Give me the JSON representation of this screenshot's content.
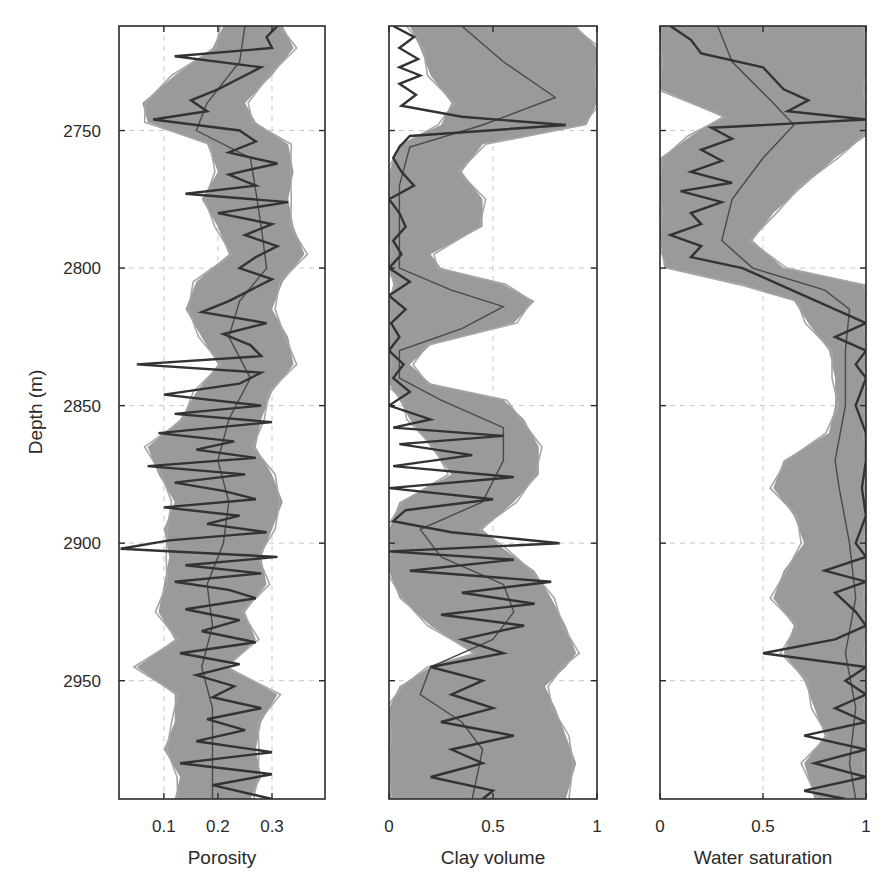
{
  "chart_data": {
    "type": "line",
    "layout": "three vertical well-log tracks sharing a depth axis (depth increasing downward)",
    "ylabel": "Depth (m)",
    "ylim": [
      2712,
      2993
    ],
    "yticks": [
      2750,
      2800,
      2850,
      2900,
      2950
    ],
    "grid": true,
    "legend": null,
    "colors": {
      "ensemble": "#9a9a9a",
      "ensemble_outline": "#a6a6a6",
      "mean": "#4a4a4a",
      "true_log": "#333333",
      "frame": "#2b2b2b",
      "grid": "#c8c8c8"
    },
    "panels": [
      {
        "xlabel": "Porosity",
        "xlim": [
          0.017,
          0.398
        ],
        "xticks": [
          0.1,
          0.2,
          0.3
        ],
        "xtick_labels": [
          "0.1",
          "0.2",
          "0.3"
        ],
        "series": [
          {
            "name": "ensemble (band of realizations)",
            "depth": [
              2712,
              2720,
              2730,
              2740,
              2747,
              2755,
              2765,
              2775,
              2785,
              2795,
              2805,
              2815,
              2825,
              2835,
              2845,
              2855,
              2865,
              2875,
              2885,
              2895,
              2905,
              2915,
              2925,
              2935,
              2945,
              2955,
              2965,
              2975,
              2985,
              2993
            ],
            "min": [
              0.21,
              0.19,
              0.12,
              0.06,
              0.07,
              0.18,
              0.2,
              0.17,
              0.2,
              0.22,
              0.16,
              0.14,
              0.17,
              0.2,
              0.16,
              0.13,
              0.07,
              0.09,
              0.12,
              0.1,
              0.11,
              0.1,
              0.09,
              0.12,
              0.05,
              0.12,
              0.12,
              0.1,
              0.13,
              0.12
            ],
            "max": [
              0.32,
              0.34,
              0.3,
              0.25,
              0.27,
              0.33,
              0.34,
              0.33,
              0.34,
              0.36,
              0.32,
              0.3,
              0.33,
              0.34,
              0.3,
              0.28,
              0.27,
              0.3,
              0.32,
              0.3,
              0.28,
              0.29,
              0.25,
              0.27,
              0.22,
              0.31,
              0.28,
              0.27,
              0.28,
              0.26
            ]
          },
          {
            "name": "ensemble mean",
            "depth": [
              2712,
              2725,
              2740,
              2750,
              2760,
              2772,
              2785,
              2800,
              2812,
              2825,
              2840,
              2855,
              2870,
              2885,
              2900,
              2915,
              2930,
              2945,
              2960,
              2975,
              2993
            ],
            "values": [
              0.25,
              0.24,
              0.18,
              0.16,
              0.26,
              0.27,
              0.28,
              0.29,
              0.24,
              0.22,
              0.26,
              0.22,
              0.2,
              0.22,
              0.21,
              0.18,
              0.19,
              0.17,
              0.19,
              0.19,
              0.19
            ]
          },
          {
            "name": "true log",
            "depth": [
              2712,
              2716,
              2720,
              2723,
              2727,
              2731,
              2735,
              2739,
              2743,
              2746,
              2750,
              2754,
              2758,
              2762,
              2766,
              2770,
              2773,
              2776,
              2780,
              2784,
              2788,
              2792,
              2796,
              2800,
              2804,
              2808,
              2812,
              2816,
              2820,
              2824,
              2828,
              2832,
              2835,
              2838,
              2842,
              2846,
              2850,
              2853,
              2856,
              2860,
              2863,
              2866,
              2869,
              2872,
              2875,
              2878,
              2881,
              2884,
              2887,
              2890,
              2893,
              2896,
              2899,
              2902,
              2905,
              2908,
              2911,
              2914,
              2917,
              2920,
              2924,
              2928,
              2932,
              2936,
              2940,
              2944,
              2948,
              2952,
              2956,
              2960,
              2964,
              2968,
              2972,
              2976,
              2980,
              2984,
              2988,
              2993
            ],
            "values": [
              0.31,
              0.29,
              0.3,
              0.12,
              0.28,
              0.24,
              0.2,
              0.15,
              0.18,
              0.08,
              0.24,
              0.27,
              0.22,
              0.31,
              0.22,
              0.27,
              0.14,
              0.33,
              0.2,
              0.3,
              0.25,
              0.31,
              0.27,
              0.24,
              0.3,
              0.26,
              0.22,
              0.17,
              0.29,
              0.21,
              0.26,
              0.28,
              0.05,
              0.28,
              0.24,
              0.1,
              0.28,
              0.12,
              0.3,
              0.09,
              0.23,
              0.16,
              0.27,
              0.07,
              0.25,
              0.12,
              0.21,
              0.27,
              0.1,
              0.24,
              0.18,
              0.29,
              0.11,
              0.02,
              0.31,
              0.14,
              0.28,
              0.12,
              0.22,
              0.27,
              0.14,
              0.24,
              0.17,
              0.27,
              0.13,
              0.24,
              0.16,
              0.23,
              0.19,
              0.28,
              0.18,
              0.25,
              0.16,
              0.3,
              0.13,
              0.3,
              0.19,
              0.3
            ]
          }
        ]
      },
      {
        "xlabel": "Clay volume",
        "xlim": [
          0,
          1
        ],
        "xticks": [
          0,
          0.5,
          1
        ],
        "xtick_labels": [
          "0",
          "0.5",
          "1"
        ],
        "series": [
          {
            "name": "ensemble (band of realizations)",
            "depth": [
              2712,
              2720,
              2730,
              2740,
              2748,
              2755,
              2765,
              2775,
              2785,
              2795,
              2800,
              2806,
              2812,
              2820,
              2828,
              2835,
              2842,
              2848,
              2855,
              2865,
              2875,
              2885,
              2895,
              2902,
              2910,
              2920,
              2930,
              2940,
              2945,
              2952,
              2960,
              2970,
              2980,
              2993
            ],
            "min": [
              0.1,
              0.15,
              0.2,
              0.3,
              0.25,
              0.05,
              0,
              0,
              0,
              0,
              0,
              0.02,
              0,
              0,
              0,
              0,
              0,
              0.05,
              0.1,
              0.2,
              0.3,
              0.05,
              0,
              0,
              0,
              0.05,
              0.2,
              0.4,
              0.2,
              0.05,
              0,
              0,
              0,
              0
            ],
            "max": [
              0.9,
              1.0,
              1.0,
              1.0,
              0.95,
              0.45,
              0.35,
              0.45,
              0.45,
              0.2,
              0.25,
              0.55,
              0.7,
              0.6,
              0.2,
              0.1,
              0.2,
              0.55,
              0.65,
              0.72,
              0.72,
              0.6,
              0.45,
              0.55,
              0.7,
              0.78,
              0.85,
              0.9,
              0.85,
              0.75,
              0.8,
              0.85,
              0.9,
              0.85
            ]
          },
          {
            "name": "ensemble mean",
            "depth": [
              2712,
              2725,
              2738,
              2748,
              2756,
              2770,
              2790,
              2800,
              2808,
              2814,
              2822,
              2830,
              2840,
              2848,
              2858,
              2870,
              2885,
              2895,
              2905,
              2915,
              2925,
              2935,
              2945,
              2955,
              2965,
              2975,
              2993
            ],
            "values": [
              0.35,
              0.55,
              0.8,
              0.45,
              0.1,
              0.05,
              0.05,
              0.05,
              0.3,
              0.55,
              0.35,
              0.05,
              0.05,
              0.25,
              0.55,
              0.55,
              0.45,
              0.15,
              0.25,
              0.55,
              0.6,
              0.5,
              0.2,
              0.15,
              0.35,
              0.45,
              0.4
            ]
          },
          {
            "name": "true log",
            "depth": [
              2712,
              2716,
              2720,
              2724,
              2727,
              2730,
              2733,
              2737,
              2741,
              2745,
              2748,
              2752,
              2756,
              2760,
              2765,
              2770,
              2775,
              2780,
              2785,
              2790,
              2795,
              2800,
              2805,
              2810,
              2815,
              2820,
              2825,
              2830,
              2835,
              2840,
              2845,
              2850,
              2855,
              2858,
              2861,
              2864,
              2868,
              2872,
              2876,
              2880,
              2884,
              2888,
              2892,
              2896,
              2900,
              2903,
              2906,
              2910,
              2914,
              2918,
              2922,
              2926,
              2930,
              2935,
              2940,
              2945,
              2950,
              2955,
              2960,
              2965,
              2970,
              2975,
              2980,
              2985,
              2990,
              2993
            ],
            "values": [
              0.02,
              0.12,
              0.05,
              0.14,
              0.05,
              0.15,
              0.05,
              0.13,
              0.06,
              0.35,
              0.85,
              0.1,
              0.05,
              0.02,
              0.06,
              0.12,
              0.0,
              0.05,
              0.08,
              0.02,
              0.06,
              0.0,
              0.1,
              0.0,
              0.08,
              0.01,
              0.05,
              0.0,
              0.07,
              0.02,
              0.1,
              0.0,
              0.2,
              0.02,
              0.55,
              0.05,
              0.4,
              0.02,
              0.6,
              0.0,
              0.5,
              0.08,
              0.02,
              0.3,
              0.82,
              0.0,
              0.6,
              0.1,
              0.78,
              0.35,
              0.7,
              0.25,
              0.65,
              0.35,
              0.55,
              0.2,
              0.45,
              0.3,
              0.5,
              0.25,
              0.6,
              0.3,
              0.45,
              0.2,
              0.5,
              0.45
            ]
          }
        ]
      },
      {
        "xlabel": "Water saturation",
        "xlim": [
          0,
          1
        ],
        "xticks": [
          0,
          0.5,
          1
        ],
        "xtick_labels": [
          "0",
          "0.5",
          "1"
        ],
        "series": [
          {
            "name": "ensemble (band of realizations)",
            "depth": [
              2712,
              2725,
              2735,
              2745,
              2752,
              2760,
              2770,
              2780,
              2790,
              2800,
              2806,
              2812,
              2820,
              2830,
              2840,
              2850,
              2860,
              2870,
              2880,
              2890,
              2900,
              2910,
              2920,
              2930,
              2940,
              2950,
              2960,
              2970,
              2980,
              2993
            ],
            "min": [
              0,
              0,
              0,
              0.3,
              0.15,
              0,
              0,
              0,
              0,
              0.02,
              0.4,
              0.65,
              0.72,
              0.82,
              0.85,
              0.85,
              0.82,
              0.6,
              0.55,
              0.65,
              0.7,
              0.6,
              0.55,
              0.65,
              0.6,
              0.7,
              0.75,
              0.8,
              0.7,
              0.75
            ],
            "max": [
              1,
              1,
              1,
              1,
              1,
              0.85,
              0.7,
              0.55,
              0.45,
              0.6,
              1,
              1,
              1,
              1,
              1,
              1,
              1,
              1,
              1,
              1,
              1,
              1,
              1,
              1,
              1,
              1,
              1,
              1,
              1,
              1
            ]
          },
          {
            "name": "ensemble mean",
            "depth": [
              2712,
              2725,
              2740,
              2748,
              2760,
              2775,
              2790,
              2800,
              2808,
              2815,
              2830,
              2850,
              2870,
              2880,
              2900,
              2920,
              2940,
              2960,
              2980,
              2993
            ],
            "values": [
              0.28,
              0.35,
              0.55,
              0.65,
              0.5,
              0.35,
              0.3,
              0.45,
              0.8,
              0.92,
              0.9,
              0.9,
              0.85,
              0.87,
              0.92,
              0.95,
              0.9,
              0.95,
              0.92,
              0.95
            ]
          },
          {
            "name": "true log",
            "depth": [
              2712,
              2717,
              2722,
              2727,
              2731,
              2735,
              2739,
              2743,
              2746,
              2749,
              2753,
              2757,
              2761,
              2765,
              2769,
              2772,
              2776,
              2780,
              2784,
              2788,
              2792,
              2796,
              2800,
              2805,
              2810,
              2815,
              2820,
              2825,
              2830,
              2835,
              2840,
              2850,
              2860,
              2870,
              2880,
              2890,
              2900,
              2905,
              2910,
              2914,
              2918,
              2925,
              2930,
              2935,
              2940,
              2945,
              2950,
              2955,
              2960,
              2965,
              2970,
              2975,
              2980,
              2985,
              2990,
              2993
            ],
            "values": [
              0.05,
              0.15,
              0.2,
              0.5,
              0.55,
              0.6,
              0.72,
              0.62,
              1.0,
              0.25,
              0.35,
              0.2,
              0.3,
              0.15,
              0.35,
              0.1,
              0.3,
              0.15,
              0.2,
              0.05,
              0.2,
              0.15,
              0.4,
              0.55,
              0.7,
              0.85,
              1.0,
              0.85,
              1.0,
              0.95,
              1.0,
              0.95,
              1.0,
              1.0,
              0.98,
              1.0,
              0.95,
              1.0,
              0.8,
              1.0,
              0.85,
              0.95,
              1.0,
              0.85,
              0.5,
              1.0,
              0.9,
              1.0,
              0.85,
              1.0,
              0.7,
              1.0,
              0.75,
              1.0,
              0.7,
              0.9
            ]
          }
        ]
      }
    ]
  },
  "figure": {
    "y_axis_title": "Depth (m)",
    "y_tick_labels": [
      "2750",
      "2800",
      "2850",
      "2900",
      "2950"
    ],
    "panel_titles": [
      "Porosity",
      "Clay volume",
      "Water saturation"
    ]
  }
}
